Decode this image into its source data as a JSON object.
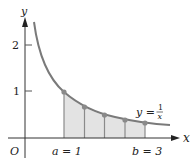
{
  "figure": {
    "axes": {
      "x_label": "x",
      "y_label": "y",
      "origin_label": "O",
      "y_ticks": [
        {
          "value": 1,
          "label": "1"
        },
        {
          "value": 2,
          "label": "2"
        }
      ]
    },
    "curve": {
      "label_lhs": "y =",
      "label_num": "1",
      "label_den": "x",
      "function": "1/x"
    },
    "interval": {
      "a_label": "a = 1",
      "b_label": "b = 3",
      "a": 1,
      "b": 3,
      "partition_points": [
        1,
        1.5,
        2,
        2.5,
        3
      ]
    },
    "colors": {
      "curve": "#7a7a7a",
      "shade": "#e3e3e3",
      "axis": "#333333",
      "point": "#8a8a8a"
    }
  }
}
